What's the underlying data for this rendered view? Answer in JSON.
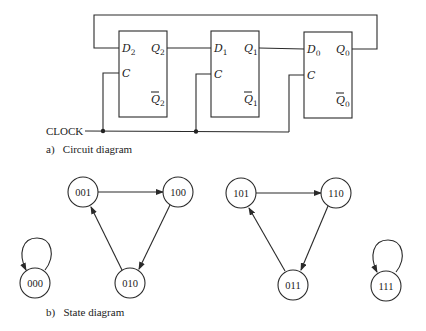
{
  "circuit": {
    "caption": "a)   Circuit diagram",
    "clock_label": "CLOCK",
    "flip_flops": [
      {
        "d_label": "D",
        "d_sub": "2",
        "c_label": "C",
        "q_label": "Q",
        "q_sub": "2",
        "qbar_label": "Q",
        "qbar_sub": "2"
      },
      {
        "d_label": "D",
        "d_sub": "1",
        "c_label": "C",
        "q_label": "Q",
        "q_sub": "1",
        "qbar_label": "Q",
        "qbar_sub": "1"
      },
      {
        "d_label": "D",
        "d_sub": "0",
        "c_label": "C",
        "q_label": "Q",
        "q_sub": "0",
        "qbar_label": "Q",
        "qbar_sub": "0"
      }
    ]
  },
  "state_diagram": {
    "caption": "b)   State diagram",
    "states": [
      "000",
      "001",
      "100",
      "010",
      "101",
      "110",
      "011",
      "111"
    ],
    "transitions": [
      {
        "from": "000",
        "to": "000"
      },
      {
        "from": "001",
        "to": "100"
      },
      {
        "from": "100",
        "to": "010"
      },
      {
        "from": "010",
        "to": "001"
      },
      {
        "from": "101",
        "to": "110"
      },
      {
        "from": "110",
        "to": "011"
      },
      {
        "from": "011",
        "to": "101"
      },
      {
        "from": "111",
        "to": "111"
      }
    ]
  }
}
